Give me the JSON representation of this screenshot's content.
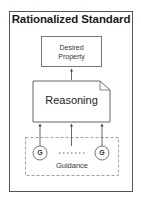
{
  "diagram": {
    "title": "Rationalized Standard",
    "desired_property": {
      "line1": "Desired",
      "line2": "Property"
    },
    "reasoning": "Reasoning",
    "guidance": {
      "label": "Guidance",
      "node_left": "G",
      "node_right": "G",
      "ellipsis": "......"
    },
    "colors": {
      "border": "#555555",
      "box_border": "#777777",
      "dashed": "#888888",
      "text": "#222222"
    }
  }
}
